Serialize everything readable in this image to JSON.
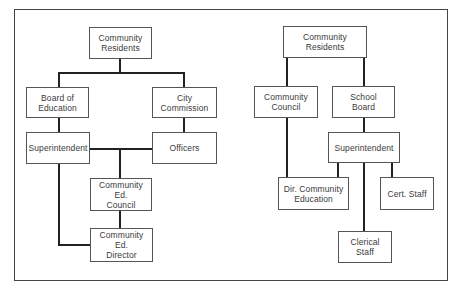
{
  "diagram": {
    "type": "organizational-chart",
    "left_chart": {
      "nodes": [
        {
          "id": "community_residents",
          "label": "Community\nResidents"
        },
        {
          "id": "board_of_education",
          "label": "Board of\nEducation"
        },
        {
          "id": "city_commission",
          "label": "City\nCommission"
        },
        {
          "id": "superintendent",
          "label": "Superintendent"
        },
        {
          "id": "officers",
          "label": "Officers"
        },
        {
          "id": "community_ed_council",
          "label": "Community\nEd.\nCouncil"
        },
        {
          "id": "community_ed_director",
          "label": "Community\nEd.\nDirector"
        }
      ],
      "edges": [
        [
          "community_residents",
          "board_of_education"
        ],
        [
          "community_residents",
          "city_commission"
        ],
        [
          "board_of_education",
          "superintendent"
        ],
        [
          "city_commission",
          "officers"
        ],
        [
          "superintendent",
          "community_ed_council"
        ],
        [
          "officers",
          "community_ed_council"
        ],
        [
          "community_ed_council",
          "community_ed_director"
        ],
        [
          "superintendent",
          "community_ed_director"
        ]
      ]
    },
    "right_chart": {
      "nodes": [
        {
          "id": "community_residents",
          "label": "Community\nResidents"
        },
        {
          "id": "community_council",
          "label": "Community\nCouncil"
        },
        {
          "id": "school_board",
          "label": "School\nBoard"
        },
        {
          "id": "superintendent",
          "label": "Superintendent"
        },
        {
          "id": "dir_community_education",
          "label": "Dir. Community\nEducation"
        },
        {
          "id": "cert_staff",
          "label": "Cert. Staff"
        },
        {
          "id": "clerical_staff",
          "label": "Clerical\nStaff"
        }
      ],
      "edges": [
        [
          "community_residents",
          "community_council"
        ],
        [
          "community_residents",
          "school_board"
        ],
        [
          "school_board",
          "superintendent"
        ],
        [
          "community_council",
          "dir_community_education"
        ],
        [
          "superintendent",
          "dir_community_education"
        ],
        [
          "superintendent",
          "clerical_staff"
        ],
        [
          "superintendent",
          "cert_staff"
        ]
      ]
    }
  },
  "left": {
    "community_residents": "Community\nResidents",
    "board_of_education": "Board of\nEducation",
    "city_commission": "City\nCommission",
    "superintendent": "Superintendent",
    "officers": "Officers",
    "community_ed_council": "Community\nEd.\nCouncil",
    "community_ed_director": "Community\nEd.\nDirector"
  },
  "right": {
    "community_residents": "Community\nResidents",
    "community_council": "Community\nCouncil",
    "school_board": "School\nBoard",
    "superintendent": "Superintendent",
    "dir_community_education": "Dir. Community\nEducation",
    "cert_staff": "Cert. Staff",
    "clerical_staff": "Clerical\nStaff"
  },
  "colors": {
    "line": "#222222",
    "border": "#555555",
    "text": "#3a3a3a"
  }
}
